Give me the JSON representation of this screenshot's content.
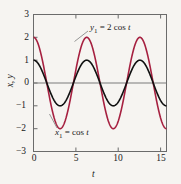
{
  "chart_data": {
    "type": "line",
    "title": "",
    "xlabel": "t",
    "ylabel": "x, y",
    "xlim": [
      0,
      15.708
    ],
    "ylim": [
      -3,
      3
    ],
    "grid": false,
    "legend_position": "inline-annotations",
    "xticks": [
      0,
      5,
      10,
      15
    ],
    "xtick_labels": [
      "0",
      "5",
      "10",
      "15"
    ],
    "yticks": [
      3,
      2,
      1,
      0,
      -1,
      -2,
      -3
    ],
    "ytick_labels": [
      "3",
      "2",
      "1",
      "0",
      "−1",
      "−2",
      "−3"
    ],
    "zero_line": 0,
    "series": [
      {
        "name": "y1",
        "label": "y₁ = 2 cos t",
        "equation": "y = 2*cos(t)",
        "amplitude": 2,
        "period": 6.2832,
        "color": "#a62040",
        "x": [
          0,
          0.7854,
          1.5708,
          2.3562,
          3.1416,
          3.927,
          4.7124,
          5.4978,
          6.2832,
          7.0686,
          7.854,
          8.6394,
          9.4248,
          10.2102,
          10.9956,
          11.781,
          12.5664,
          13.3518,
          14.1372,
          14.9226,
          15.708
        ],
        "values": [
          2,
          1.414,
          0,
          -1.414,
          -2,
          -1.414,
          0,
          1.414,
          2,
          1.414,
          0,
          -1.414,
          -2,
          -1.414,
          0,
          1.414,
          2,
          1.414,
          0,
          -1.414,
          -2
        ]
      },
      {
        "name": "x1",
        "label": "x₁ = cos t",
        "equation": "x = cos(t)",
        "amplitude": 1,
        "period": 6.2832,
        "color": "#111111",
        "x": [
          0,
          0.7854,
          1.5708,
          2.3562,
          3.1416,
          3.927,
          4.7124,
          5.4978,
          6.2832,
          7.0686,
          7.854,
          8.6394,
          9.4248,
          10.2102,
          10.9956,
          11.781,
          12.5664,
          13.3518,
          14.1372,
          14.9226,
          15.708
        ],
        "values": [
          1,
          0.707,
          0,
          -0.707,
          -1,
          -0.707,
          0,
          0.707,
          1,
          0.707,
          0,
          -0.707,
          -1,
          -0.707,
          0,
          0.707,
          1,
          0.707,
          0,
          -0.707,
          -1
        ]
      }
    ],
    "annotations": [
      {
        "text_prefix": "y",
        "sub": "1",
        "text_suffix": " = 2 cos t",
        "target_series": "y1"
      },
      {
        "text_prefix": "x",
        "sub": "1",
        "text_suffix": " = cos t",
        "target_series": "x1"
      }
    ]
  },
  "axes": {
    "ylabel_x": "x",
    "ylabel_comma": ", ",
    "ylabel_y": "y",
    "xlabel": "t"
  },
  "ticks": {
    "y": [
      "3",
      "2",
      "1",
      "0",
      "−1",
      "−2",
      "−3"
    ],
    "x": [
      "0",
      "5",
      "10",
      "15"
    ]
  },
  "annotation_y1": {
    "var": "y",
    "sub": "1",
    "rest": " = 2 cos ",
    "tvar": "t"
  },
  "annotation_x1": {
    "var": "x",
    "sub": "1",
    "rest": " = cos ",
    "tvar": "t"
  },
  "colors": {
    "red_curve": "#a62040",
    "black_curve": "#111111",
    "frame": "#6b6b6b",
    "zero_line": "#7a7a7a",
    "background": "#f6f4f1",
    "leader": "#8a8a8a"
  }
}
